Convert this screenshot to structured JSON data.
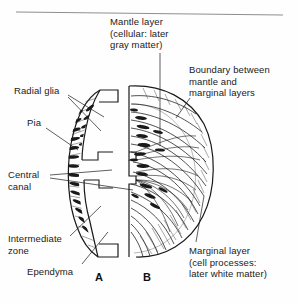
{
  "figure": {
    "type": "scientific-line-diagram",
    "background_color": "#fefefe",
    "ink_color": "#1a1a1a",
    "top_rule": true,
    "panels": [
      {
        "id": "A",
        "label": "A",
        "description": "Crescent-shaped half cross-section showing radial glia spanning from ependyma to pia"
      },
      {
        "id": "B",
        "label": "B",
        "description": "D-shaped half cross-section showing mantle and marginal layers with radiating fiber processes"
      }
    ],
    "labels": [
      {
        "name": "mantle-layer",
        "line1": "Mantle layer",
        "line2": "(cellular: later",
        "line3": "gray matter)",
        "leader": "vertical line down into panel B"
      },
      {
        "name": "boundary",
        "line1": "Boundary between",
        "line2": "mantle and",
        "line3": "marginal layers",
        "leader": "diagonal line to inner arc of panel B"
      },
      {
        "name": "radial-glia",
        "line1": "Radial glia",
        "leader": "two diagonal lines to panel A"
      },
      {
        "name": "pia",
        "line1": "Pia",
        "leader": "diagonal line to outer edge of panel A"
      },
      {
        "name": "central-canal",
        "line1": "Central",
        "line2": "canal",
        "leader": "two lines to central canal between panels"
      },
      {
        "name": "intermediate-zone",
        "line1": "Intermediate",
        "line2": "zone",
        "leader": "diagonal line to panel A outer region"
      },
      {
        "name": "ependyma",
        "line1": "Ependyma",
        "leader": "diagonal line to inner edge of panel A"
      },
      {
        "name": "marginal-layer",
        "line1": "Marginal layer",
        "line2": "(cell processes:",
        "line3": "later white matter)",
        "leader": "diagonal line up into panel B outer region"
      }
    ]
  }
}
